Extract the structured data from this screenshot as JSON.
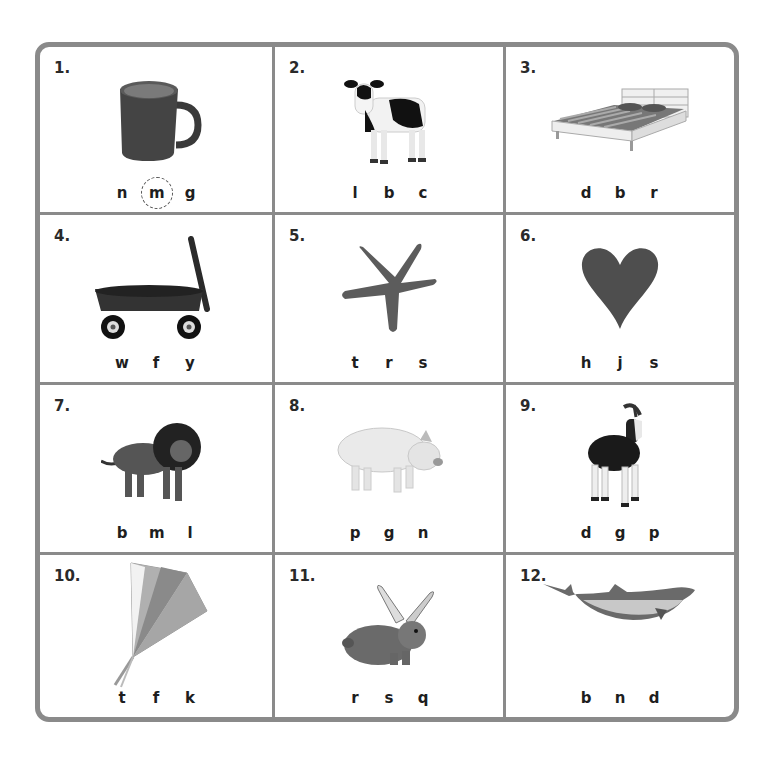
{
  "worksheet": {
    "border_color": "#8a8a8a",
    "items": [
      {
        "number": "1.",
        "picture": "mug-icon",
        "letters": [
          "n",
          "m",
          "g"
        ],
        "circled_index": 1
      },
      {
        "number": "2.",
        "picture": "cow-icon",
        "letters": [
          "l",
          "b",
          "c"
        ]
      },
      {
        "number": "3.",
        "picture": "bed-icon",
        "letters": [
          "d",
          "b",
          "r"
        ]
      },
      {
        "number": "4.",
        "picture": "wagon-icon",
        "letters": [
          "w",
          "f",
          "y"
        ]
      },
      {
        "number": "5.",
        "picture": "starfish-icon",
        "letters": [
          "t",
          "r",
          "s"
        ]
      },
      {
        "number": "6.",
        "picture": "heart-icon",
        "letters": [
          "h",
          "j",
          "s"
        ]
      },
      {
        "number": "7.",
        "picture": "lion-icon",
        "letters": [
          "b",
          "m",
          "l"
        ]
      },
      {
        "number": "8.",
        "picture": "pig-icon",
        "letters": [
          "p",
          "g",
          "n"
        ]
      },
      {
        "number": "9.",
        "picture": "goat-icon",
        "letters": [
          "d",
          "g",
          "p"
        ]
      },
      {
        "number": "10.",
        "picture": "kite-icon",
        "letters": [
          "t",
          "f",
          "k"
        ]
      },
      {
        "number": "11.",
        "picture": "rabbit-icon",
        "letters": [
          "r",
          "s",
          "q"
        ]
      },
      {
        "number": "12.",
        "picture": "dolphin-icon",
        "letters": [
          "b",
          "n",
          "d"
        ]
      }
    ]
  }
}
